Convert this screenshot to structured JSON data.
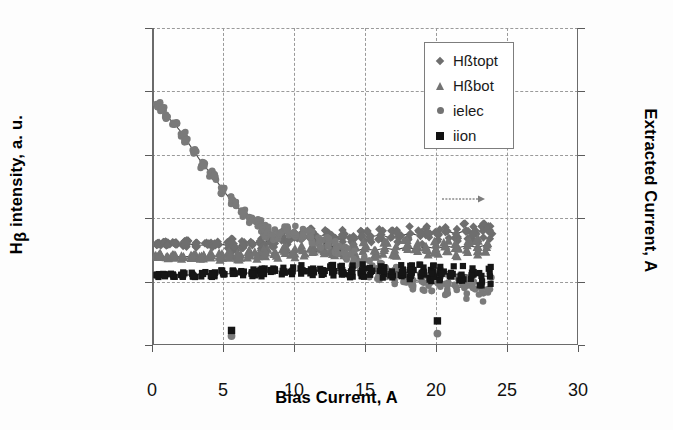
{
  "axes": {
    "left": {
      "title": "Hβ intensity, a. u.",
      "title_main": "H",
      "title_sub": "β",
      "title_rest": " intensity, a. u.",
      "ticks": [
        "0.0E+00",
        "5.0E+18",
        "1.0E+19",
        "1.5E+19",
        "2.0E+19",
        "2.5E+19"
      ],
      "tick_values": [
        0,
        5e+18,
        1e+19,
        1.5e+19,
        2e+19,
        2.5e+19
      ],
      "min": 0,
      "max": 2.5e+19
    },
    "right": {
      "title": "Extracted Current, A",
      "ticks": [
        "0",
        "1",
        "2",
        "3",
        "4",
        "5"
      ],
      "tick_values": [
        0,
        1,
        2,
        3,
        4,
        5
      ],
      "min": 0,
      "max": 5
    },
    "bottom": {
      "title": "Bias Current, A",
      "ticks": [
        "0",
        "5",
        "10",
        "15",
        "20",
        "25",
        "30"
      ],
      "tick_values": [
        0,
        5,
        10,
        15,
        20,
        25,
        30
      ],
      "min": 0,
      "max": 30
    }
  },
  "legend": {
    "items": [
      {
        "label": "Hßtopt",
        "marker": "diamond-marker",
        "color": "#6e6e6e"
      },
      {
        "label": "Hßbot",
        "marker": "triangle-marker",
        "color": "#737373"
      },
      {
        "label": "ielec",
        "marker": "circle-marker",
        "color": "#737373"
      },
      {
        "label": "iion",
        "marker": "square-marker",
        "color": "#111111"
      }
    ]
  },
  "colors": {
    "gray_marker": "#7a7a7a",
    "gray_marker_light": "#9b9b9b",
    "black_marker": "#151515",
    "gridline": "#9a9a9a",
    "axis": "#6b6b6b",
    "trend_line": "#4a4a4a"
  },
  "annotation": {
    "arrow": {
      "x": 22.0,
      "y": 1.15e+19,
      "direction": "right"
    }
  },
  "chart_data": {
    "type": "scatter",
    "title": "",
    "xlabel": "Bias Current, A",
    "ylabel": "Hβ intensity, a. u.",
    "ylabel_secondary": "Extracted Current, A",
    "xlim": [
      0,
      30
    ],
    "ylim": [
      0,
      2.5e+19
    ],
    "ylim_secondary": [
      0,
      5
    ],
    "grid": true,
    "legend_position": "top-right",
    "series": [
      {
        "name": "Hßtopt",
        "marker": "diamond",
        "color": "#6e6e6e",
        "axis": "left",
        "has_trend_line": true,
        "points": [
          [
            0.4,
            8.05e+18
          ],
          [
            0.5,
            7.95e+18
          ],
          [
            0.9,
            8e+18
          ],
          [
            1.1,
            7.9e+18
          ],
          [
            1.6,
            8e+18
          ],
          [
            2.3,
            7.9e+18
          ],
          [
            2.4,
            8.05e+18
          ],
          [
            3.1,
            7.85e+18
          ],
          [
            3.9,
            7.9e+18
          ],
          [
            4.3,
            7.95e+18
          ],
          [
            4.6,
            8e+18
          ],
          [
            5.4,
            7.85e+18
          ],
          [
            5.6,
            8.1e+18
          ],
          [
            5.8,
            7.7e+18
          ],
          [
            6.4,
            7.95e+18
          ],
          [
            7.1,
            8e+18
          ],
          [
            7.6,
            8.2e+18
          ],
          [
            7.8,
            7.8e+18
          ],
          [
            8.2,
            8.35e+18
          ],
          [
            8.6,
            8.1e+18
          ],
          [
            9.2,
            8.6e+18
          ],
          [
            9.6,
            8.3e+18
          ],
          [
            10.1,
            8.75e+18
          ],
          [
            10.4,
            8.4e+18
          ],
          [
            11.2,
            8.8e+18
          ],
          [
            11.6,
            8.5e+18
          ],
          [
            12.3,
            8.7e+18
          ],
          [
            12.8,
            8.45e+18
          ],
          [
            13.4,
            8.6e+18
          ],
          [
            14.1,
            8.4e+18
          ],
          [
            14.8,
            8.65e+18
          ],
          [
            15.3,
            8.5e+18
          ],
          [
            16.1,
            8.7e+18
          ],
          [
            16.8,
            8.45e+18
          ],
          [
            17.4,
            8.6e+18
          ],
          [
            18.2,
            8.8e+18
          ],
          [
            18.9,
            8.6e+18
          ],
          [
            19.4,
            8.9e+18
          ],
          [
            20.1,
            8.7e+18
          ],
          [
            20.8,
            9e+18
          ],
          [
            21.4,
            8.75e+18
          ],
          [
            22.1,
            9.05e+18
          ],
          [
            22.7,
            8.8e+18
          ],
          [
            23.3,
            9e+18
          ],
          [
            23.8,
            8.85e+18
          ]
        ]
      },
      {
        "name": "Hßbot",
        "marker": "triangle",
        "color": "#737373",
        "axis": "left",
        "has_trend_line": true,
        "points": [
          [
            0.4,
            6.95e+18
          ],
          [
            0.6,
            7.05e+18
          ],
          [
            1.0,
            6.9e+18
          ],
          [
            1.5,
            7e+18
          ],
          [
            2.2,
            6.95e+18
          ],
          [
            2.9,
            7e+18
          ],
          [
            3.5,
            6.9e+18
          ],
          [
            4.2,
            7.05e+18
          ],
          [
            4.8,
            6.95e+18
          ],
          [
            5.5,
            7.1e+18
          ],
          [
            6.1,
            7e+18
          ],
          [
            6.8,
            7.15e+18
          ],
          [
            7.4,
            7.05e+18
          ],
          [
            8.0,
            7.3e+18
          ],
          [
            8.7,
            7.2e+18
          ],
          [
            9.3,
            7.4e+18
          ],
          [
            9.9,
            7.25e+18
          ],
          [
            10.6,
            7.45e+18
          ],
          [
            11.3,
            7.3e+18
          ],
          [
            12.0,
            7.5e+18
          ],
          [
            12.7,
            7.35e+18
          ],
          [
            13.5,
            7.55e+18
          ],
          [
            14.2,
            7.4e+18
          ],
          [
            15.0,
            7.6e+18
          ],
          [
            15.7,
            7.45e+18
          ],
          [
            16.4,
            7.65e+18
          ],
          [
            17.1,
            7.5e+18
          ],
          [
            17.9,
            7.7e+18
          ],
          [
            18.6,
            7.55e+18
          ],
          [
            19.3,
            7.75e+18
          ],
          [
            20.0,
            7.6e+18
          ],
          [
            20.7,
            7.8e+18
          ],
          [
            21.5,
            7.65e+18
          ],
          [
            22.2,
            7.85e+18
          ],
          [
            22.9,
            7.7e+18
          ],
          [
            23.6,
            7.9e+18
          ]
        ]
      },
      {
        "name": "ielec",
        "marker": "circle",
        "color": "#7a7a7a",
        "axis": "right",
        "has_trend_line": true,
        "description": "steep decay then noisy plateau",
        "points": [
          [
            0.4,
            1.9e+19
          ],
          [
            0.5,
            1.88e+19
          ],
          [
            0.7,
            1.86e+19
          ],
          [
            1.1,
            1.8e+19
          ],
          [
            1.6,
            1.74e+19
          ],
          [
            2.2,
            1.66e+19
          ],
          [
            2.4,
            1.62e+19
          ],
          [
            3.0,
            1.52e+19
          ],
          [
            3.6,
            1.42e+19
          ],
          [
            4.2,
            1.35e+19
          ],
          [
            4.4,
            1.32e+19
          ],
          [
            5.0,
            1.22e+19
          ],
          [
            5.6,
            1.14e+19
          ],
          [
            5.9,
            1.1e+19
          ],
          [
            6.4,
            1.04e+19
          ],
          [
            7.0,
            9.8e+18
          ],
          [
            7.5,
            9.5e+18
          ],
          [
            7.8,
            9.2e+18
          ],
          [
            8.1,
            8.9e+18
          ],
          [
            8.5,
            8.7e+18
          ],
          [
            9.0,
            8.8e+18
          ],
          [
            9.5,
            9e+18
          ],
          [
            10.0,
            8.9e+18
          ],
          [
            10.6,
            8.7e+18
          ],
          [
            11.2,
            8.5e+18
          ],
          [
            11.8,
            8.2e+18
          ],
          [
            12.4,
            7.9e+18
          ],
          [
            13.0,
            7.6e+18
          ],
          [
            13.6,
            7.2e+18
          ],
          [
            14.2,
            6.8e+18
          ],
          [
            14.8,
            6.3e+18
          ],
          [
            15.4,
            6e+18
          ],
          [
            16.0,
            5.8e+18
          ],
          [
            16.6,
            5.6e+18
          ],
          [
            17.2,
            5.5e+18
          ],
          [
            17.8,
            5.3e+18
          ],
          [
            18.4,
            5.1e+18
          ],
          [
            19.0,
            5e+18
          ],
          [
            19.6,
            4.9e+18
          ],
          [
            20.2,
            4.8e+18
          ],
          [
            20.8,
            4.7e+18
          ],
          [
            21.4,
            4.6e+18
          ],
          [
            22.0,
            4.5e+18
          ],
          [
            22.6,
            4.5e+18
          ],
          [
            23.2,
            4.4e+18
          ],
          [
            23.8,
            4.4e+18
          ]
        ],
        "outliers": [
          [
            5.6,
            7e+17
          ],
          [
            20.1,
            9e+17
          ]
        ]
      },
      {
        "name": "iion",
        "marker": "square",
        "color": "#151515",
        "axis": "right",
        "has_trend_line": true,
        "points": [
          [
            0.4,
            5.5e+18
          ],
          [
            0.9,
            5.45e+18
          ],
          [
            1.5,
            5.5e+18
          ],
          [
            2.2,
            5.55e+18
          ],
          [
            2.9,
            5.5e+18
          ],
          [
            3.6,
            5.6e+18
          ],
          [
            4.3,
            5.55e+18
          ],
          [
            5.0,
            5.65e+18
          ],
          [
            5.7,
            5.6e+18
          ],
          [
            6.4,
            5.7e+18
          ],
          [
            7.1,
            5.65e+18
          ],
          [
            7.8,
            5.75e+18
          ],
          [
            8.5,
            5.8e+18
          ],
          [
            9.2,
            5.85e+18
          ],
          [
            9.9,
            5.8e+18
          ],
          [
            10.6,
            5.9e+18
          ],
          [
            11.3,
            5.85e+18
          ],
          [
            12.0,
            5.9e+18
          ],
          [
            12.7,
            5.85e+18
          ],
          [
            13.4,
            5.9e+18
          ],
          [
            14.1,
            5.85e+18
          ],
          [
            14.8,
            5.9e+18
          ],
          [
            15.5,
            5.85e+18
          ],
          [
            16.2,
            5.8e+18
          ],
          [
            16.9,
            5.8e+18
          ],
          [
            17.6,
            5.75e+18
          ],
          [
            18.3,
            5.7e+18
          ],
          [
            19.0,
            5.7e+18
          ],
          [
            19.7,
            5.65e+18
          ],
          [
            20.4,
            5.6e+18
          ],
          [
            21.1,
            5.6e+18
          ],
          [
            21.8,
            5.55e+18
          ],
          [
            22.5,
            5.5e+18
          ],
          [
            23.2,
            5.45e+18
          ],
          [
            23.8,
            5.4e+18
          ]
        ],
        "outliers": [
          [
            5.6,
            1.15e+18
          ],
          [
            20.1,
            1.9e+18
          ]
        ]
      }
    ]
  }
}
